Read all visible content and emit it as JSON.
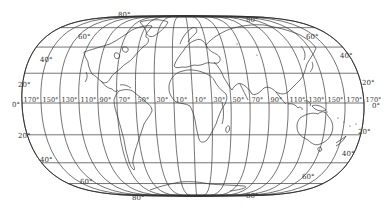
{
  "map": {
    "title": "",
    "projection": "world-graticule-lens",
    "line_color": "#333333",
    "background_color": "#ffffff",
    "equator_label": "0°",
    "equator_label_right": "0°",
    "longitude_labels": [
      "170°",
      "150°",
      "130°",
      "110°",
      "90°",
      "70°",
      "50°",
      "30°",
      "10°",
      "10°",
      "30°",
      "50°",
      "70°",
      "90°",
      "110°",
      "130°",
      "150°",
      "170°",
      "170°"
    ],
    "latitude_labels_left": [
      {
        "label": "80°",
        "hemisphere": "N"
      },
      {
        "label": "60°",
        "hemisphere": "N"
      },
      {
        "label": "40°",
        "hemisphere": "N"
      },
      {
        "label": "20°",
        "hemisphere": "N"
      },
      {
        "label": "0°",
        "hemisphere": "EQ"
      },
      {
        "label": "20°",
        "hemisphere": "S"
      },
      {
        "label": "40°",
        "hemisphere": "S"
      },
      {
        "label": "60°",
        "hemisphere": "S"
      },
      {
        "label": "80°",
        "hemisphere": "S"
      }
    ],
    "latitude_labels_right": [
      {
        "label": "80°",
        "hemisphere": "N"
      },
      {
        "label": "60°",
        "hemisphere": "N"
      },
      {
        "label": "40°",
        "hemisphere": "N"
      },
      {
        "label": "20°",
        "hemisphere": "N"
      },
      {
        "label": "0°",
        "hemisphere": "EQ"
      },
      {
        "label": "20°",
        "hemisphere": "S"
      },
      {
        "label": "40°",
        "hemisphere": "S"
      },
      {
        "label": "60°",
        "hemisphere": "S"
      },
      {
        "label": "80°",
        "hemisphere": "S"
      }
    ]
  }
}
